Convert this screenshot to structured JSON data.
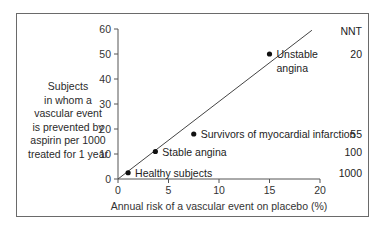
{
  "chart_data": {
    "type": "scatter",
    "title": "",
    "xlabel": "Annual risk of a vascular event on placebo (%)",
    "ylabel": "Subjects in whom a vascular event is prevented by aspirin per 1000 treated for 1 year",
    "ylabel_lines": [
      "Subjects",
      "in whom a",
      "vascular event",
      "is prevented by",
      "aspirin per 1000",
      "treated for 1 year"
    ],
    "xlim": [
      0,
      20
    ],
    "ylim": [
      0,
      60
    ],
    "x_ticks": [
      0,
      5,
      10,
      15,
      20
    ],
    "y_ticks": [
      0,
      10,
      20,
      30,
      40,
      50,
      60
    ],
    "grid": false,
    "trend_line": {
      "x": [
        0,
        19.2
      ],
      "y": [
        0,
        59.5
      ]
    },
    "nnt_header": "NNT",
    "series": [
      {
        "name": "Groups",
        "points": [
          {
            "label": "Healthy subjects",
            "label_lines": [
              "Healthy subjects"
            ],
            "x": 1.0,
            "y": 2.5,
            "nnt": "1000"
          },
          {
            "label": "Stable angina",
            "label_lines": [
              "Stable angina"
            ],
            "x": 3.7,
            "y": 11,
            "nnt": "100"
          },
          {
            "label": "Survivors of myocardial infarction",
            "label_lines": [
              "Survivors of myocardial infarction"
            ],
            "x": 7.5,
            "y": 18,
            "nnt": "55"
          },
          {
            "label": "Unstable angina",
            "label_lines": [
              "Unstable",
              "angina"
            ],
            "x": 15,
            "y": 50,
            "nnt": "20"
          }
        ]
      }
    ]
  },
  "colors": {
    "axis": "#555555",
    "line": "#444444",
    "point": "#111111",
    "frame": "#6a6a6a"
  }
}
